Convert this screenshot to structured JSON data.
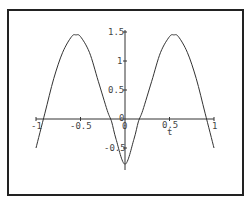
{
  "chart_data": {
    "type": "line",
    "title": "",
    "xlabel": "t",
    "ylabel": "",
    "xlim": [
      -1,
      1
    ],
    "ylim": [
      -0.78,
      1.5
    ],
    "grid": false,
    "legend": null,
    "x_ticks": [
      -1,
      -0.5,
      0,
      0.5,
      1
    ],
    "x_tick_labels": [
      "-1",
      "-0.5",
      "0",
      "0.5",
      "1"
    ],
    "y_ticks": [
      -0.5,
      0,
      0.5,
      1,
      1.5
    ],
    "y_tick_labels": [
      "-0.5",
      "0",
      "0.5",
      "1",
      "1.5"
    ],
    "series": [
      {
        "name": "f(t)",
        "x": [
          -1,
          -0.9,
          -0.8,
          -0.7,
          -0.6,
          -0.55,
          -0.5,
          -0.4,
          -0.3,
          -0.2,
          -0.15,
          -0.1,
          0,
          0.1,
          0.15,
          0.2,
          0.3,
          0.4,
          0.5,
          0.55,
          0.6,
          0.7,
          0.8,
          0.9,
          1
        ],
        "values": [
          -0.5,
          0.1,
          0.7,
          1.15,
          1.42,
          1.45,
          1.42,
          1.15,
          0.65,
          0.15,
          -0.05,
          -0.35,
          -0.78,
          -0.35,
          -0.05,
          0.15,
          0.65,
          1.15,
          1.42,
          1.45,
          1.42,
          1.15,
          0.7,
          0.1,
          -0.5
        ]
      }
    ]
  },
  "labels": {
    "x_axis": "t",
    "xt_m1": "-1",
    "xt_m05": "-0.5",
    "xt_0": "0",
    "xt_05": "0.5",
    "xt_1": "1",
    "yt_15": "1.5",
    "yt_1": "1",
    "yt_05": "0.5",
    "yt_0": "0",
    "yt_m05": "-0.5"
  }
}
